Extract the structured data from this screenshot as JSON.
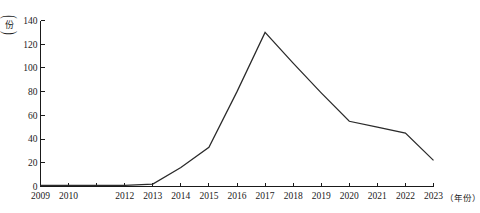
{
  "figure": {
    "cut_off_header": "",
    "y_unit_open": "(",
    "y_unit_char": "份",
    "y_unit_close": ")",
    "x_unit": "（年份）"
  },
  "chart_data": {
    "type": "line",
    "title": "",
    "xlabel": "年份",
    "ylabel": "份",
    "x": [
      2009,
      2010,
      2011,
      2012,
      2013,
      2014,
      2015,
      2016,
      2017,
      2018,
      2019,
      2020,
      2021,
      2022,
      2023
    ],
    "categories": [
      "2009",
      "2010",
      "2011",
      "2012",
      "2013",
      "2014",
      "2015",
      "2016",
      "2017",
      "2018",
      "2019",
      "2020",
      "2021",
      "2022",
      "2023"
    ],
    "x_tick_labels": [
      "2009",
      "2010",
      "",
      "2012",
      "2013",
      "2014",
      "2015",
      "2016",
      "2017",
      "2018",
      "2019",
      "2020",
      "2021",
      "2022",
      "2023"
    ],
    "values": [
      1,
      1,
      1,
      1,
      2,
      16,
      33,
      80,
      130,
      104,
      79,
      55,
      50,
      45,
      22
    ],
    "series": [
      {
        "name": "份",
        "values": [
          1,
          1,
          1,
          1,
          2,
          16,
          33,
          80,
          130,
          104,
          79,
          55,
          50,
          45,
          22
        ]
      }
    ],
    "y_ticks": [
      0,
      20,
      40,
      60,
      80,
      100,
      120,
      140
    ],
    "y_tick_labels": [
      "0",
      "20",
      "40",
      "60",
      "80",
      "100",
      "120",
      "140"
    ],
    "ylim": [
      0,
      140
    ],
    "xlim": [
      2009,
      2023
    ],
    "grid": false,
    "legend": false,
    "line_color": "#2a2a2a",
    "axis_color": "#1a1a1a"
  }
}
